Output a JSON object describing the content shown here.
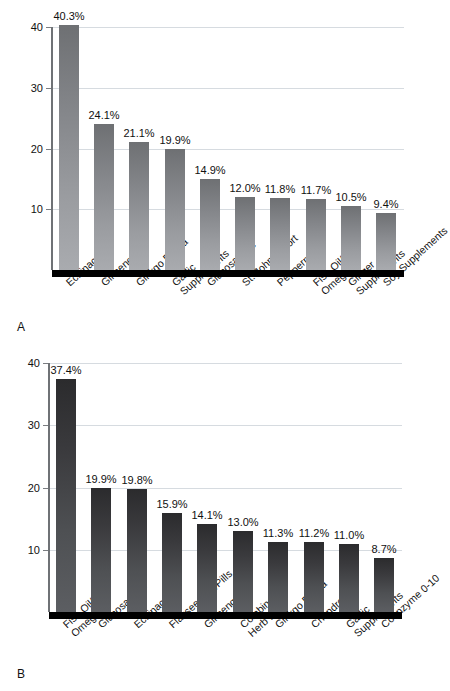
{
  "figure": {
    "panels": [
      {
        "letter": "A",
        "chart_data": {
          "type": "bar",
          "title": "",
          "xlabel": "",
          "ylabel": "",
          "ylim": [
            0,
            40
          ],
          "yticks": [
            10,
            20,
            30,
            40
          ],
          "ytick_labels": [
            "10",
            "20",
            "30",
            "40"
          ],
          "grid": true,
          "legend": "none",
          "categories": [
            "Echinacea",
            "Ginseng",
            "Ginkgo Biloba",
            "Garlic\nSupplements",
            "Glucosamine",
            "St. John's Wort",
            "Peppermint",
            "Fish Oil/\nOmega 3",
            "Ginger\nSupplements",
            "Soy Supplements"
          ],
          "values": [
            40.3,
            24.1,
            21.1,
            19.9,
            14.9,
            12.0,
            11.8,
            11.7,
            10.5,
            9.4
          ],
          "value_labels": [
            "40.3%",
            "24.1%",
            "21.1%",
            "19.9%",
            "14.9%",
            "12.0%",
            "11.8%",
            "11.7%",
            "10.5%",
            "9.4%"
          ]
        }
      },
      {
        "letter": "B",
        "chart_data": {
          "type": "bar",
          "title": "",
          "xlabel": "",
          "ylabel": "",
          "ylim": [
            0,
            40
          ],
          "yticks": [
            10,
            20,
            30,
            40
          ],
          "ytick_labels": [
            "10",
            "20",
            "30",
            "40"
          ],
          "grid": true,
          "legend": "none",
          "categories": [
            "Fish Oil/\nOmega 3",
            "Glucosamine",
            "Echinacea",
            "Flaxseed Oil/Pills",
            "Ginseng",
            "Combination\nHerb Pills",
            "Ginkgo Biloba",
            "Chondroitin",
            "Garlic\nSupplements",
            "Coenzyme 0-10"
          ],
          "values": [
            37.4,
            19.9,
            19.8,
            15.9,
            14.1,
            13.0,
            11.3,
            11.2,
            11.0,
            8.7
          ],
          "value_labels": [
            "37.4%",
            "19.9%",
            "19.8%",
            "15.9%",
            "14.1%",
            "13.0%",
            "11.3%",
            "11.2%",
            "11.0%",
            "8.7%"
          ]
        }
      }
    ],
    "colors": {
      "panel_a_bar_top": "#6e7073",
      "panel_a_bar_bottom": "#a9abaf",
      "panel_b_bar_top": "#2b2b2d",
      "panel_b_bar_bottom": "#5c5e62",
      "axis": "#6f7276",
      "baseline": "#000000",
      "gridline": "#d6dbe0",
      "text": "#111111",
      "background": "#ffffff"
    }
  }
}
